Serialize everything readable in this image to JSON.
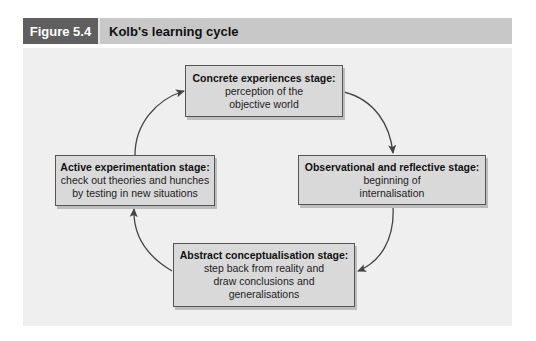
{
  "figure": {
    "number": "Figure 5.4",
    "title": "Kolb's learning cycle",
    "colors": {
      "badge_bg": "#5f5f5f",
      "header_bg": "#c8c8c8",
      "panel_bg": "#efefef",
      "box_bg": "#d9d9d9",
      "box_border": "#555555",
      "arrow": "#444444"
    }
  },
  "stages": [
    {
      "id": "concrete",
      "title": "Concrete experiences stage:",
      "lines": [
        "perception of the",
        "objective world"
      ]
    },
    {
      "id": "observational",
      "title": "Observational and reflective stage:",
      "lines": [
        "beginning of",
        "internalisation"
      ]
    },
    {
      "id": "abstract",
      "title": "Abstract conceptualisation stage:",
      "lines": [
        "step back from reality and",
        "draw conclusions and",
        "generalisations"
      ]
    },
    {
      "id": "active",
      "title": "Active experimentation stage:",
      "lines": [
        "check out theories and hunches",
        "by testing in new situations"
      ]
    }
  ],
  "cycle_order": [
    "concrete",
    "observational",
    "abstract",
    "active",
    "concrete"
  ]
}
